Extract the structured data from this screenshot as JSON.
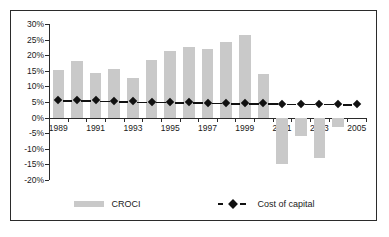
{
  "chart_data": {
    "type": "bar",
    "title": "",
    "xlabel": "",
    "ylabel": "",
    "ylim": [
      -20,
      30
    ],
    "ytick_step": 5,
    "grid": false,
    "legend_position": "bottom",
    "x": [
      1989,
      1990,
      1991,
      1992,
      1993,
      1994,
      1995,
      1996,
      1997,
      1998,
      1999,
      2000,
      2001,
      2002,
      2003,
      2004,
      2005
    ],
    "xtick_labels": [
      "1989",
      "1991",
      "1993",
      "1995",
      "1997",
      "1999",
      "2001",
      "2003",
      "2005"
    ],
    "xtick_years": [
      1989,
      1991,
      1993,
      1995,
      1997,
      1999,
      2001,
      2003,
      2005
    ],
    "ytick_labels": [
      "30%",
      "25%",
      "20%",
      "15%",
      "10%",
      "5%",
      "0%",
      "-5%",
      "-10%",
      "-15%",
      "-20%"
    ],
    "ytick_values": [
      30,
      25,
      20,
      15,
      10,
      5,
      0,
      -5,
      -10,
      -15,
      -20
    ],
    "series": [
      {
        "name": "CROCI",
        "kind": "bar",
        "color": "#c9c9c9",
        "values": [
          15.2,
          18.2,
          14.4,
          15.5,
          12.8,
          18.5,
          21.5,
          22.5,
          22.0,
          24.2,
          26.5,
          14.0,
          -15.0,
          -6.0,
          -13.0,
          -3.0,
          0.0
        ]
      },
      {
        "name": "Cost of capital",
        "kind": "line-marker",
        "color": "#111111",
        "values": [
          5.7,
          5.6,
          5.5,
          5.4,
          5.2,
          5.1,
          5.0,
          4.9,
          4.8,
          4.7,
          4.6,
          4.6,
          4.5,
          4.5,
          4.4,
          4.4,
          4.3
        ]
      }
    ]
  },
  "legend": {
    "items": [
      {
        "label": "CROCI",
        "swatch": "bar-swatch",
        "color": "#c9c9c9"
      },
      {
        "label": "Cost of capital",
        "swatch": "dashed-diamond-swatch",
        "color": "#111111"
      }
    ]
  },
  "colors": {
    "bar": "#c9c9c9",
    "line": "#111111",
    "axis": "#2b2b2b",
    "frame": "#2b2b2b",
    "background": "#ffffff",
    "text": "#1a1a1a"
  }
}
